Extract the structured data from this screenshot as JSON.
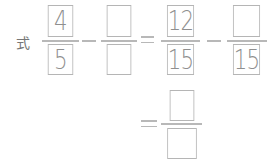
{
  "expression": {
    "label": "式",
    "fractions": [
      {
        "numerator": "4",
        "denominator": "5"
      },
      {
        "numerator": "",
        "denominator": ""
      },
      {
        "numerator": "12",
        "denominator": "15"
      },
      {
        "numerator": "",
        "denominator": "15"
      }
    ],
    "operators": [
      "−",
      "=",
      "−"
    ],
    "result": {
      "equals": "=",
      "numerator": "",
      "denominator": ""
    }
  }
}
